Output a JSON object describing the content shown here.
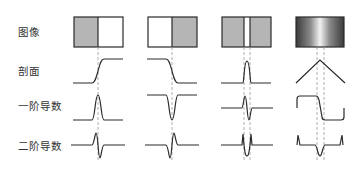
{
  "rows": [
    {
      "label": "图像",
      "top": 24
    },
    {
      "label": "剖面",
      "top": 63
    },
    {
      "label": "一阶导数",
      "top": 98
    },
    {
      "label": "二阶导数",
      "top": 138
    }
  ],
  "columns": [
    {
      "name": "step-up-edge",
      "description": "dark-to-light step edge"
    },
    {
      "name": "step-down-edge",
      "description": "light-to-dark step edge"
    },
    {
      "name": "thin-line",
      "description": "thin bright line on gray"
    },
    {
      "name": "ramp-roof",
      "description": "gradient roof edge"
    }
  ],
  "colors": {
    "gray_fill": "#b5b5b5",
    "stroke": "#2a2a2a",
    "guide": "#999999"
  }
}
